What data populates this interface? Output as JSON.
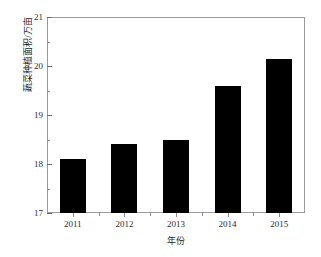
{
  "chart_data": {
    "type": "bar",
    "title": "",
    "subtitle": "",
    "xlabel": "年份",
    "ylabel": "蔬菜种植面积/万亩",
    "categories": [
      "2011",
      "2012",
      "2013",
      "2014",
      "2015"
    ],
    "values": [
      18.1,
      18.4,
      18.5,
      19.6,
      20.15
    ],
    "series": [
      {
        "name": "蔬菜种植面积",
        "values": [
          18.1,
          18.4,
          18.5,
          19.6,
          20.15
        ]
      }
    ],
    "ylim": [
      17,
      21
    ],
    "ytick_labels": [
      "17",
      "18",
      "19",
      "20",
      "21"
    ],
    "ytick_values": [
      17,
      18,
      19,
      20,
      21
    ],
    "yminor_values": [
      17.5,
      18.5,
      19.5,
      20.5
    ],
    "xtick_labels": [
      "2011",
      "2012",
      "2013",
      "2014",
      "2015"
    ],
    "grid": false,
    "legend": false,
    "legend_position": "none",
    "bar_color": "#000000",
    "frame_color": "#9a9a9a",
    "annotations": []
  }
}
